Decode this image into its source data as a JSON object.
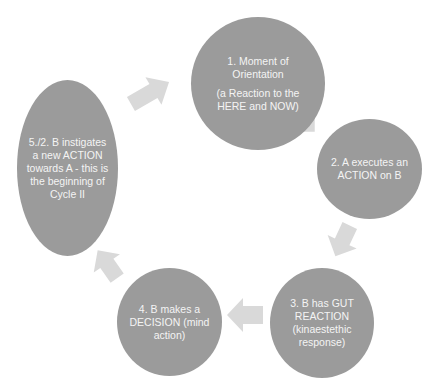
{
  "diagram": {
    "type": "cycle",
    "colors": {
      "node_fill": "#9b9b9b",
      "node_text": "#f4f4f4",
      "arrow_fill": "#d9d9d9",
      "background": "#ffffff"
    },
    "nodes": [
      {
        "id": "1",
        "lines": [
          "1. Moment of Orientation",
          "(a Reaction to the HERE and NOW)"
        ]
      },
      {
        "id": "2",
        "lines": [
          "2. A executes an ACTION on B"
        ]
      },
      {
        "id": "3",
        "lines": [
          "3. B has GUT REACTION (kinaestethic response)"
        ]
      },
      {
        "id": "4",
        "lines": [
          "4. B makes a DECISION (mind action)"
        ]
      },
      {
        "id": "5",
        "lines": [
          "5./2. B instigates a new ACTION towards A - this is the beginning of Cycle II"
        ]
      }
    ],
    "edges": [
      {
        "from": "5",
        "to": "1"
      },
      {
        "from": "1",
        "to": "2"
      },
      {
        "from": "2",
        "to": "3"
      },
      {
        "from": "3",
        "to": "4"
      },
      {
        "from": "4",
        "to": "5"
      }
    ]
  }
}
